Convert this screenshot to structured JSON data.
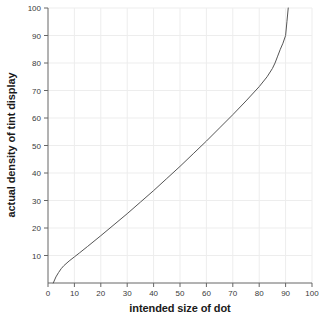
{
  "chart_data": {
    "type": "line",
    "title": "",
    "xlabel": "intended size of dot",
    "ylabel": "actual density of tint display",
    "xlim": [
      0,
      100
    ],
    "ylim": [
      0,
      100
    ],
    "grid": true,
    "legend": null,
    "xticks": [
      0,
      10,
      20,
      30,
      40,
      50,
      60,
      70,
      80,
      90,
      100
    ],
    "yticks": [
      10,
      20,
      30,
      40,
      50,
      60,
      70,
      80,
      90,
      100
    ],
    "line_color": "#555555",
    "series": [
      {
        "name": "dot gain curve",
        "x": [
          2,
          3,
          4,
          5,
          6,
          8,
          10,
          12,
          15,
          20,
          25,
          30,
          35,
          40,
          45,
          50,
          55,
          60,
          65,
          70,
          75,
          80,
          83,
          85,
          86,
          87,
          88,
          89,
          90,
          90.5,
          91
        ],
        "y": [
          0,
          2.2,
          3.8,
          5.2,
          6.3,
          8.0,
          9.5,
          11.0,
          13.3,
          17.2,
          21.2,
          25.2,
          29.4,
          33.6,
          38.0,
          42.4,
          47.0,
          51.6,
          56.4,
          61.2,
          66.2,
          71.4,
          75.0,
          78.0,
          80.0,
          82.5,
          85.0,
          87.2,
          90.0,
          95.0,
          100
        ]
      }
    ]
  },
  "axes": {
    "x_tick_labels": [
      "0",
      "10",
      "20",
      "30",
      "40",
      "50",
      "60",
      "70",
      "80",
      "90",
      "100"
    ],
    "y_tick_labels": [
      "10",
      "20",
      "30",
      "40",
      "50",
      "60",
      "70",
      "80",
      "90",
      "100"
    ]
  }
}
